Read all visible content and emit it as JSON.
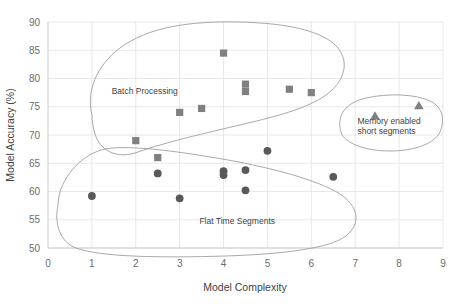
{
  "chart_data": {
    "type": "scatter",
    "title": "",
    "xlabel": "Model Complexity",
    "ylabel": "Model Accuracy (%)",
    "xlim": [
      0,
      9
    ],
    "ylim": [
      50,
      90
    ],
    "xticks": [
      0,
      1,
      2,
      3,
      4,
      5,
      6,
      7,
      8,
      9
    ],
    "yticks": [
      50,
      55,
      60,
      65,
      70,
      75,
      80,
      85,
      90
    ],
    "xtick_labels": [
      "0",
      "1",
      "2",
      "3",
      "4",
      "5",
      "6",
      "7",
      "8",
      "9"
    ],
    "ytick_labels": [
      "50",
      "55",
      "60",
      "65",
      "70",
      "75",
      "80",
      "85",
      "90"
    ],
    "grid": true,
    "legend": "none",
    "series": [
      {
        "name": "Batch Processing",
        "marker": "square",
        "color": "#808080",
        "points": [
          {
            "x": 2.0,
            "y": 69.0
          },
          {
            "x": 2.5,
            "y": 66.0
          },
          {
            "x": 3.0,
            "y": 74.0
          },
          {
            "x": 3.5,
            "y": 74.7
          },
          {
            "x": 4.0,
            "y": 84.5
          },
          {
            "x": 4.5,
            "y": 79.0
          },
          {
            "x": 4.5,
            "y": 77.7
          },
          {
            "x": 5.5,
            "y": 78.1
          },
          {
            "x": 6.0,
            "y": 77.5
          }
        ]
      },
      {
        "name": "Flat Time Segments",
        "marker": "circle",
        "color": "#595959",
        "points": [
          {
            "x": 1.0,
            "y": 59.2
          },
          {
            "x": 2.5,
            "y": 63.2
          },
          {
            "x": 3.0,
            "y": 58.8
          },
          {
            "x": 4.0,
            "y": 63.6
          },
          {
            "x": 4.0,
            "y": 62.9
          },
          {
            "x": 4.5,
            "y": 63.8
          },
          {
            "x": 4.5,
            "y": 60.2
          },
          {
            "x": 5.0,
            "y": 67.2
          },
          {
            "x": 6.5,
            "y": 62.6
          }
        ]
      },
      {
        "name": "Memory enabled short segments",
        "marker": "triangle",
        "color": "#808080",
        "points": [
          {
            "x": 7.45,
            "y": 73.4
          },
          {
            "x": 8.45,
            "y": 75.2
          }
        ]
      }
    ],
    "annotations": [
      {
        "text": "Batch Processing",
        "x": 1.45,
        "y": 77.3
      },
      {
        "text": "Flat Time Segments",
        "x": 3.45,
        "y": 54.2
      },
      {
        "text": "Memory enabled",
        "x": 7.05,
        "y": 72.0
      },
      {
        "text": "short segments",
        "x": 7.05,
        "y": 70.1
      }
    ],
    "cluster_outlines": [
      {
        "name": "batch-processing-cluster"
      },
      {
        "name": "flat-time-segments-cluster"
      },
      {
        "name": "memory-enabled-cluster"
      }
    ]
  },
  "axes": {
    "x_title": "Model Complexity",
    "y_title": "Model Accuracy (%)"
  },
  "colors": {
    "square_marker": "#808080",
    "circle_marker": "#595959",
    "triangle_marker": "#808080",
    "gridline": "#e2e2e2",
    "axisline": "#c9c9c9",
    "outline": "#9a9a9a",
    "text": "#4a4a4a"
  }
}
